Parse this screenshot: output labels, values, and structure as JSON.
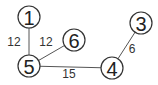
{
  "graph": {
    "nodes": [
      {
        "id": "1",
        "label": "1",
        "x": 29,
        "y": 17
      },
      {
        "id": "5",
        "label": "5",
        "x": 29,
        "y": 66
      },
      {
        "id": "6",
        "label": "6",
        "x": 74,
        "y": 40
      },
      {
        "id": "4",
        "label": "4",
        "x": 112,
        "y": 68
      },
      {
        "id": "3",
        "label": "3",
        "x": 141,
        "y": 23
      }
    ],
    "edges": [
      {
        "from": "1",
        "to": "5",
        "weight": "12",
        "lx": 14,
        "ly": 42
      },
      {
        "from": "5",
        "to": "6",
        "weight": "12",
        "lx": 46,
        "ly": 42
      },
      {
        "from": "5",
        "to": "4",
        "weight": "15",
        "lx": 69,
        "ly": 74
      },
      {
        "from": "4",
        "to": "3",
        "weight": "6",
        "lx": 132,
        "ly": 49
      }
    ]
  }
}
